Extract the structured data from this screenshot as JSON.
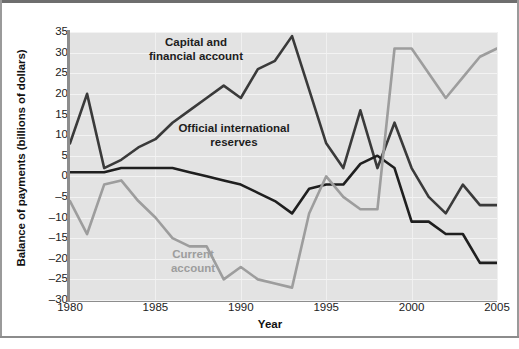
{
  "figure": {
    "ylabel": "Balance of payments (billions of dollars)",
    "xlabel": "Year"
  },
  "annotations": {
    "capital": "Capital and financial account",
    "official": "Official international reserves",
    "current": "Current account"
  },
  "colors": {
    "plot_background": "#e3e3e3",
    "capital_and_financial_account": "#3a3a3a",
    "official_international_reserves": "#1f1f1f",
    "current_account": "#9d9d9d",
    "gridline": "#f3f3f3",
    "axis": "#8d8d8d"
  },
  "chart_data": {
    "type": "line",
    "title": "",
    "xlabel": "Year",
    "ylabel": "Balance of payments (billions of dollars)",
    "xlim": [
      1980,
      2005
    ],
    "ylim": [
      -30,
      35
    ],
    "xticks": [
      1980,
      1985,
      1990,
      1995,
      2000,
      2005
    ],
    "yticks": [
      -30,
      -25,
      -20,
      -15,
      -10,
      -5,
      0,
      5,
      10,
      15,
      20,
      25,
      30,
      35
    ],
    "grid": true,
    "legend": "inline-annotations",
    "x": [
      1980,
      1981,
      1982,
      1983,
      1984,
      1985,
      1986,
      1987,
      1988,
      1989,
      1990,
      1991,
      1992,
      1993,
      1994,
      1995,
      1996,
      1997,
      1998,
      1999,
      2000,
      2001,
      2002,
      2003,
      2004,
      2005
    ],
    "series": [
      {
        "name": "Capital and financial account",
        "color": "#3a3a3a",
        "values": [
          8,
          20,
          2,
          4,
          7,
          9,
          13,
          16,
          19,
          22,
          19,
          26,
          28,
          34,
          21,
          8,
          2,
          16,
          2,
          13,
          2,
          -5,
          -9,
          -2,
          -7,
          -7
        ]
      },
      {
        "name": "Official international reserves",
        "color": "#1f1f1f",
        "values": [
          1,
          1,
          1,
          2,
          2,
          2,
          2,
          1,
          0,
          -1,
          -2,
          -4,
          -6,
          -9,
          -3,
          -2,
          -2,
          3,
          5,
          2,
          -11,
          -11,
          -14,
          -14,
          -21,
          -21
        ]
      },
      {
        "name": "Current account",
        "color": "#9d9d9d",
        "values": [
          -6,
          -14,
          -2,
          -1,
          -6,
          -10,
          -15,
          -17,
          -17,
          -25,
          -22,
          -25,
          -26,
          -27,
          -9,
          0,
          -5,
          -8,
          -8,
          31,
          31,
          25,
          19,
          24,
          29,
          31
        ]
      }
    ]
  }
}
